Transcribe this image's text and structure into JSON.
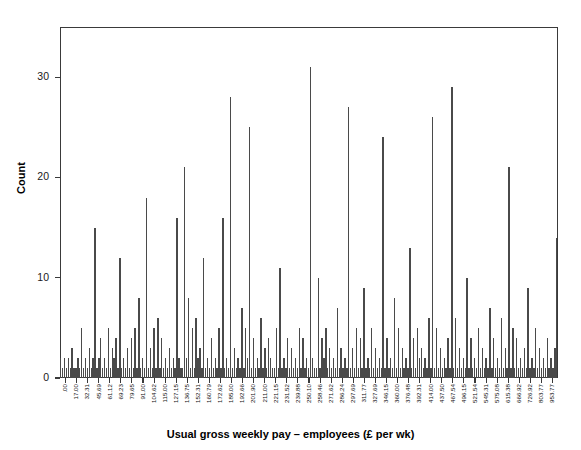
{
  "chart_data": {
    "type": "bar",
    "title": "",
    "xlabel": "Usual gross weekly pay – employees (£ per wk)",
    "ylabel": "Count",
    "ylim": [
      0,
      35
    ],
    "yticks": [
      0,
      10,
      20,
      30
    ],
    "ytick_labels": [
      "0",
      "10",
      "20",
      "30"
    ],
    "grid": false,
    "legend": false,
    "bar_color": "#4a4a4a",
    "axis_color": "#3a3a3a",
    "xtick_labels": [
      ".00",
      "17.00",
      "32.31",
      "45.69",
      "61.12",
      "69.23",
      "79.65",
      "91.00",
      "104.62",
      "115.00",
      "127.15",
      "136.75",
      "152.31",
      "160.79",
      "172.62",
      "185.00",
      "192.66",
      "201.90",
      "211.00",
      "221.15",
      "231.52",
      "239.88",
      "250.10",
      "258.46",
      "271.62",
      "286.24",
      "297.69",
      "311.77",
      "327.69",
      "346.15",
      "360.00",
      "376.48",
      "392.31",
      "414.00",
      "437.50",
      "467.54",
      "496.15",
      "521.54",
      "545.31",
      "575.08",
      "615.38",
      "666.92",
      "726.92",
      "803.77",
      "953.77"
    ],
    "categories": [
      "0.00",
      "3.69",
      "7.38",
      "11.08",
      "14.77",
      "18.46",
      "22.15",
      "25.85",
      "29.54",
      "33.23",
      "36.92",
      "40.62",
      "44.31",
      "48.00",
      "51.69",
      "55.38",
      "59.08",
      "62.77",
      "66.46",
      "70.15",
      "73.85",
      "77.54",
      "81.23",
      "84.92",
      "88.62",
      "92.31",
      "96.00",
      "99.69",
      "103.38",
      "107.08",
      "110.77",
      "114.46",
      "118.15",
      "121.85",
      "125.54",
      "129.23",
      "132.92",
      "136.62",
      "140.31",
      "144.00",
      "147.69",
      "151.38",
      "155.08",
      "158.77",
      "162.46",
      "166.15",
      "169.85",
      "173.54",
      "177.23",
      "180.92",
      "184.62",
      "188.31",
      "192.00",
      "195.69",
      "199.38",
      "203.08",
      "206.77",
      "210.46",
      "214.15",
      "217.85",
      "221.54",
      "225.23",
      "228.92",
      "232.62",
      "236.31",
      "240.00",
      "243.69",
      "247.38",
      "251.08",
      "254.77",
      "258.46",
      "262.15",
      "265.85",
      "269.54",
      "273.23",
      "276.92",
      "280.62",
      "284.31",
      "288.00",
      "291.69",
      "295.38",
      "299.08",
      "302.77",
      "306.46",
      "310.15",
      "313.85",
      "317.54",
      "321.23",
      "324.92",
      "328.62",
      "332.31",
      "336.00",
      "339.69",
      "343.38",
      "347.08",
      "350.77",
      "354.46",
      "358.15",
      "361.85",
      "365.54",
      "369.23",
      "372.92",
      "376.62",
      "380.31",
      "384.00",
      "387.69",
      "391.38",
      "395.08",
      "398.77",
      "402.46",
      "406.15",
      "409.85",
      "413.54",
      "417.23",
      "420.92",
      "424.62",
      "428.31",
      "432.00",
      "435.69",
      "439.38",
      "443.08",
      "446.77",
      "450.46",
      "454.15",
      "457.85",
      "461.54",
      "465.23",
      "468.92",
      "472.62",
      "476.31",
      "480.00",
      "483.69",
      "487.38",
      "491.08",
      "494.77",
      "498.46",
      "502.15",
      "505.85",
      "509.54",
      "513.23",
      "516.92",
      "520.62",
      "524.31",
      "528.00",
      "531.69",
      "535.38",
      "539.08",
      "542.77",
      "546.46",
      "550.15",
      "553.85",
      "557.54",
      "561.23",
      "564.92",
      "568.62",
      "572.31",
      "576.00",
      "579.69",
      "583.38",
      "587.08",
      "590.77",
      "594.46",
      "598.15",
      "601.85",
      "605.54",
      "609.23",
      "612.92",
      "616.62",
      "620.31",
      "624.00",
      "627.69",
      "631.38",
      "635.08",
      "638.77",
      "642.46",
      "646.15",
      "649.85",
      "653.54",
      "657.23",
      "660.92",
      "664.62",
      "668.31",
      "672.00",
      "675.69",
      "679.38",
      "683.08",
      "686.77",
      "690.46",
      "694.15",
      "697.85",
      "701.54",
      "705.23",
      "708.92",
      "712.62",
      "716.31",
      "720.00",
      "723.69",
      "727.38",
      "731.08",
      "734.77",
      "738.46",
      "742.15",
      "745.85",
      "749.54",
      "753.23",
      "756.92",
      "760.62",
      "764.31",
      "768.00",
      "771.69",
      "775.38",
      "779.08",
      "782.77",
      "786.46",
      "790.15",
      "793.85",
      "797.54",
      "801.23",
      "804.92",
      "808.62",
      "812.31",
      "816.00",
      "819.69",
      "823.38",
      "827.08",
      "830.77",
      "834.46",
      "838.15",
      "841.85",
      "845.54",
      "849.23",
      "852.92",
      "856.62",
      "860.31",
      "864.00",
      "867.69",
      "871.38",
      "875.08",
      "878.77",
      "882.46",
      "886.15",
      "889.85",
      "893.54",
      "897.23",
      "900.92",
      "904.62",
      "908.31",
      "912.00",
      "915.69",
      "919.38",
      "923.08",
      "926.77",
      "930.46",
      "934.15",
      "937.85",
      "941.54",
      "945.23",
      "948.92",
      "952.62",
      "956.31",
      "960.00"
    ],
    "values": [
      2,
      1,
      2,
      1,
      2,
      1,
      3,
      1,
      1,
      2,
      1,
      5,
      1,
      2,
      1,
      3,
      1,
      2,
      15,
      1,
      2,
      4,
      1,
      2,
      1,
      5,
      1,
      3,
      2,
      4,
      1,
      12,
      1,
      2,
      1,
      3,
      1,
      4,
      1,
      5,
      1,
      8,
      1,
      2,
      1,
      18,
      1,
      3,
      1,
      5,
      1,
      6,
      1,
      4,
      1,
      2,
      1,
      3,
      1,
      2,
      1,
      16,
      2,
      1,
      1,
      21,
      2,
      8,
      1,
      5,
      1,
      6,
      2,
      3,
      1,
      12,
      1,
      2,
      1,
      4,
      1,
      2,
      1,
      5,
      1,
      16,
      1,
      2,
      1,
      28,
      1,
      3,
      1,
      2,
      1,
      7,
      1,
      5,
      2,
      25,
      1,
      4,
      1,
      2,
      1,
      6,
      1,
      3,
      1,
      4,
      2,
      1,
      1,
      5,
      1,
      11,
      1,
      2,
      1,
      4,
      1,
      3,
      1,
      2,
      1,
      5,
      1,
      4,
      1,
      2,
      1,
      31,
      2,
      1,
      1,
      10,
      1,
      4,
      2,
      5,
      1,
      3,
      1,
      2,
      1,
      7,
      1,
      3,
      1,
      2,
      1,
      27,
      1,
      3,
      1,
      5,
      1,
      4,
      1,
      9,
      1,
      2,
      1,
      5,
      1,
      3,
      1,
      2,
      1,
      24,
      1,
      4,
      1,
      2,
      1,
      8,
      1,
      5,
      1,
      3,
      1,
      2,
      1,
      13,
      1,
      4,
      1,
      5,
      2,
      3,
      1,
      2,
      1,
      6,
      1,
      26,
      1,
      5,
      1,
      3,
      1,
      2,
      1,
      4,
      1,
      29,
      1,
      6,
      1,
      3,
      1,
      2,
      1,
      10,
      1,
      4,
      1,
      2,
      1,
      5,
      1,
      3,
      1,
      2,
      1,
      7,
      1,
      4,
      1,
      2,
      1,
      6,
      1,
      3,
      1,
      21,
      1,
      5,
      1,
      4,
      1,
      2,
      1,
      3,
      1,
      9,
      1,
      2,
      1,
      5,
      1,
      3,
      1,
      2,
      1,
      4,
      1,
      2,
      1,
      3,
      14
    ]
  }
}
